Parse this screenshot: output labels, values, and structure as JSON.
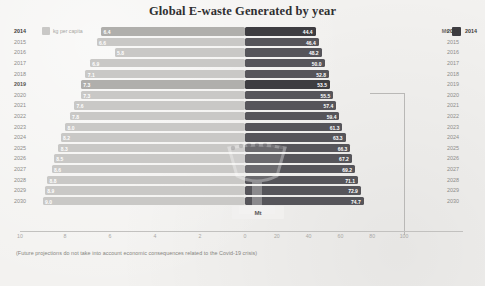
{
  "chart_data": {
    "type": "bar",
    "title": "Global E-waste Generated by year",
    "subtype": "diverging-bidirectional-bar",
    "categories": [
      "2014",
      "2015",
      "2016",
      "2017",
      "2018",
      "2019",
      "2020",
      "2021",
      "2022",
      "2023",
      "2024",
      "2025",
      "2026",
      "2027",
      "2028",
      "2029",
      "2030"
    ],
    "series": [
      {
        "name": "kg per capita",
        "unit": "kg per capita",
        "direction": "left",
        "color": "#c9c8c6",
        "values": [
          6.4,
          6.6,
          5.8,
          6.9,
          7.1,
          7.3,
          7.3,
          7.6,
          7.8,
          8.0,
          8.2,
          8.3,
          8.5,
          8.6,
          8.8,
          8.9,
          9.0
        ]
      },
      {
        "name": "Mt",
        "unit": "Mt",
        "direction": "right",
        "color": "#56555a",
        "values": [
          44.4,
          46.4,
          48.2,
          50.0,
          52.8,
          53.5,
          55.5,
          57.4,
          59.4,
          61.3,
          63.3,
          66.3,
          67.2,
          69.2,
          71.1,
          72.9,
          74.7
        ]
      }
    ],
    "axis_left": {
      "label": "kg per capita",
      "ticks": [
        10,
        8,
        6,
        4,
        2,
        0
      ],
      "range": [
        10,
        0
      ],
      "direction": "descending"
    },
    "axis_right": {
      "label": "Mt",
      "ticks": [
        0,
        20,
        40,
        60,
        80,
        100
      ],
      "range": [
        0,
        100
      ],
      "direction": "ascending"
    },
    "grid": false,
    "legend_position": "top-left and top-right",
    "annotations": [
      "(Future projections do not take into account economic consequences related to the Covid-19 crisis)"
    ]
  },
  "header": {
    "title": "Global E-waste Generated by year"
  },
  "legend": {
    "left": {
      "label": "kg per capita",
      "swatch_color": "#c9c8c6"
    },
    "right": {
      "unit_label": "Mt",
      "swatch_color": "#3e3d41",
      "year_label": "2014"
    }
  },
  "watermark": {
    "label": "Mt",
    "icon": "cup-trophy-watermark"
  },
  "footnote": {
    "text": "(Future projections do not take into account economic consequences related to the Covid-19 crisis)"
  },
  "colors": {
    "background": "#f3f2f0",
    "bar_left": "#c9c8c6",
    "bar_left_highlight": "#b0afac",
    "bar_right": "#56555a",
    "bar_right_highlight": "#3e3d41",
    "title_text": "#2f2f31",
    "muted_text": "#8d8c8a"
  }
}
